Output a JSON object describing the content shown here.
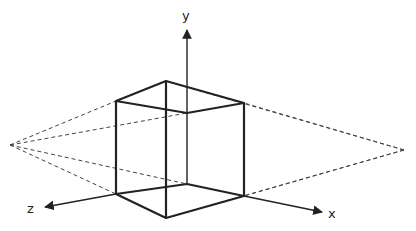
{
  "diagram": {
    "axes": {
      "x_label": "x",
      "y_label": "y",
      "z_label": "z"
    },
    "colors": {
      "stroke": "#222222",
      "dashed": "#444444",
      "background": "#ffffff"
    },
    "vanishing_points": {
      "left": [
        10,
        145
      ],
      "right": [
        404,
        150
      ]
    }
  }
}
